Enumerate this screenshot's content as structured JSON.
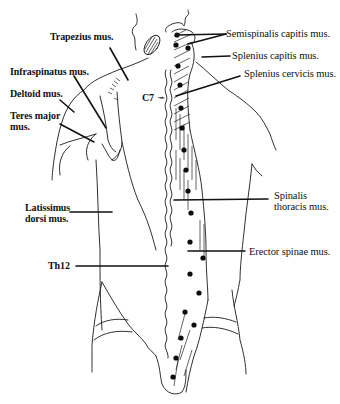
{
  "figure": {
    "labels": {
      "trapezius": "Trapezius mus.",
      "infraspinatus": "Infraspinatus mus.",
      "deltoid": "Deltoid mus.",
      "teres_major_line1": "Teres major",
      "teres_major_line2": "mus.",
      "latissimus_line1": "Latissimus",
      "latissimus_line2": "dorsi mus.",
      "th12": "Th12",
      "c7": "C7",
      "c7_arrow": "→",
      "semispinalis": "Semispinalis capitis mus.",
      "splenius_capitis": "Splenius capitis mus.",
      "splenius_cervicis": "Splenius cervicis mus.",
      "spinalis_line1": "Spinalis",
      "spinalis_line2": "thoracis mus.",
      "erector_spinae": "Erector spinae mus."
    },
    "markers": {
      "count": 16,
      "description": "black dots marking points along the right paravertebral muscles"
    },
    "colors": {
      "ink": "#111111",
      "background": "#ffffff"
    }
  }
}
